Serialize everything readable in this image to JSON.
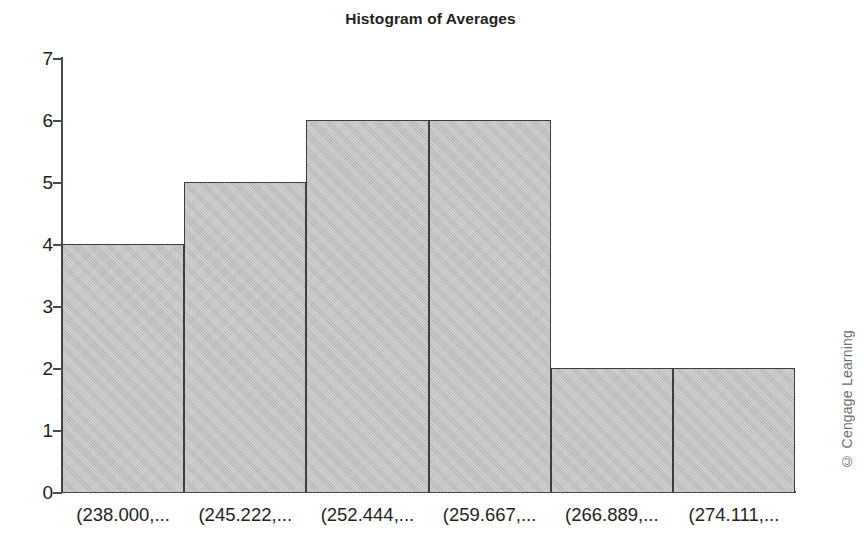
{
  "chart_data": {
    "type": "bar",
    "title": "Histogram of Averages",
    "xlabel": "",
    "ylabel": "",
    "categories": [
      "(238.000,...",
      "(245.222,...",
      "(252.444,...",
      "(259.667,...",
      "(266.889,...",
      "(274.111,..."
    ],
    "values": [
      4,
      5,
      6,
      6,
      2,
      2
    ],
    "ylim": [
      0,
      7
    ],
    "yticks": [
      0,
      1,
      2,
      3,
      4,
      5,
      6,
      7
    ],
    "ytick_labels": [
      "0",
      "1",
      "2",
      "3",
      "4",
      "5",
      "6",
      "7"
    ],
    "grid": false,
    "legend": null,
    "bar_fill_color": "#bfbfbf",
    "bar_edge_color": "#3d3d3d",
    "axis_color": "#4a4a4a",
    "text_color": "#231f20",
    "bin_width": 7.222,
    "bin_edges": [
      238.0,
      245.222,
      252.444,
      259.667,
      266.889,
      274.111,
      281.333
    ]
  },
  "credit": {
    "text": "© Cengage Learning",
    "color": "#6e6e6e"
  }
}
